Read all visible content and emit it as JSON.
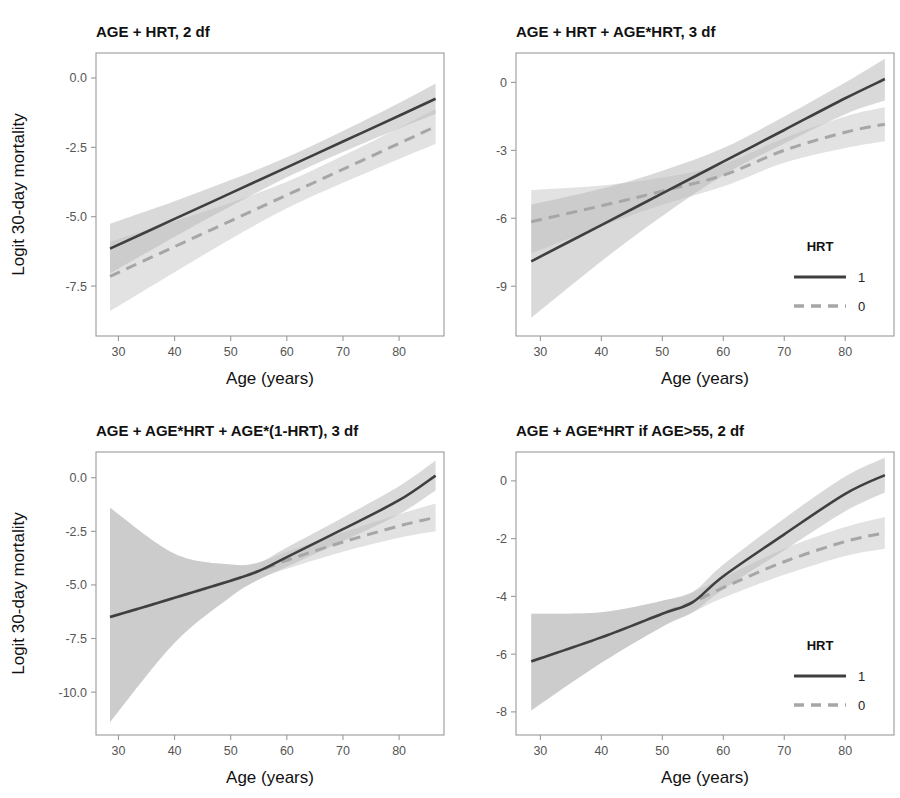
{
  "figure": {
    "width": 900,
    "height": 798,
    "background": "#ffffff",
    "panel_count": 4
  },
  "style": {
    "solid_line_color": "#3f3f3f",
    "dashed_line_color": "#a6a6a6",
    "band_solid_color": "#b9b9b9",
    "band_dashed_color": "#d8d8d8",
    "frame_color": "#9a9a9a",
    "tick_label_color": "#555555",
    "title_color": "#111111"
  },
  "legend": {
    "title": "HRT",
    "entries": [
      {
        "label": "1",
        "style": "solid",
        "color": "#3f3f3f"
      },
      {
        "label": "0",
        "style": "dashed",
        "color": "#a6a6a6"
      }
    ]
  },
  "axes_common": {
    "xlabel": "Age (years)",
    "ylabel": "Logit 30-day mortality",
    "xlim": [
      26,
      88
    ],
    "xticks": [
      30,
      40,
      50,
      60,
      70,
      80
    ],
    "xticklabels": [
      "30",
      "40",
      "50",
      "60",
      "70",
      "80"
    ],
    "grid": false,
    "x_data_range": [
      28.5,
      86.5
    ]
  },
  "chart_data": [
    {
      "id": "panel-tl",
      "type": "line",
      "position": "top-left",
      "title": "AGE + HRT, 2 df",
      "xlabel": "Age (years)",
      "ylabel": "Logit 30-day mortality",
      "xlim": [
        26,
        88
      ],
      "ylim": [
        -9.3,
        0.9
      ],
      "xticks": [
        30,
        40,
        50,
        60,
        70,
        80
      ],
      "xticklabels": [
        "30",
        "40",
        "50",
        "60",
        "70",
        "80"
      ],
      "yticks": [
        0.0,
        -2.5,
        -5.0,
        -7.5
      ],
      "yticklabels": [
        "0.0",
        "-2.5",
        "-5.0",
        "-7.5"
      ],
      "show_ylabel": true,
      "show_legend": false,
      "grid": false,
      "x": [
        28.5,
        40,
        50,
        60,
        70,
        80,
        86.5
      ],
      "series": [
        {
          "name": "1",
          "style": "solid",
          "color": "#3f3f3f",
          "values": [
            -6.15,
            -5.08,
            -4.15,
            -3.22,
            -2.29,
            -1.36,
            -0.75
          ],
          "ci_lower": [
            -7.05,
            -5.72,
            -4.62,
            -3.58,
            -2.67,
            -1.82,
            -1.3
          ],
          "ci_upper": [
            -5.25,
            -4.44,
            -3.68,
            -2.86,
            -1.91,
            -0.9,
            -0.2
          ]
        },
        {
          "name": "0",
          "style": "dashed",
          "color": "#a6a6a6",
          "values": [
            -7.15,
            -6.08,
            -5.15,
            -4.22,
            -3.29,
            -2.36,
            -1.75
          ],
          "ci_lower": [
            -8.4,
            -7.0,
            -5.8,
            -4.7,
            -3.78,
            -2.92,
            -2.38
          ],
          "ci_upper": [
            -5.9,
            -5.16,
            -4.5,
            -3.74,
            -2.8,
            -1.8,
            -1.12
          ]
        }
      ]
    },
    {
      "id": "panel-tr",
      "type": "line",
      "position": "top-right",
      "title": "AGE + HRT + AGE*HRT, 3 df",
      "xlabel": "Age (years)",
      "ylabel": "",
      "xlim": [
        26,
        88
      ],
      "ylim": [
        -11.2,
        1.3
      ],
      "xticks": [
        30,
        40,
        50,
        60,
        70,
        80
      ],
      "xticklabels": [
        "30",
        "40",
        "50",
        "60",
        "70",
        "80"
      ],
      "yticks": [
        0,
        -3,
        -6,
        -9
      ],
      "yticklabels": [
        "0",
        "-3",
        "-6",
        "-9"
      ],
      "show_ylabel": false,
      "show_legend": true,
      "grid": false,
      "x": [
        28.5,
        40,
        50,
        60,
        70,
        80,
        86.5
      ],
      "series": [
        {
          "name": "1",
          "style": "solid",
          "color": "#3f3f3f",
          "values": [
            -7.9,
            -6.3,
            -4.9,
            -3.5,
            -2.1,
            -0.7,
            0.15
          ],
          "ci_lower": [
            -10.4,
            -7.9,
            -5.9,
            -4.1,
            -2.7,
            -1.4,
            -0.8
          ],
          "ci_upper": [
            -5.4,
            -4.7,
            -3.9,
            -2.9,
            -1.5,
            0.0,
            1.05
          ]
        },
        {
          "name": "0",
          "style": "dashed",
          "color": "#a6a6a6",
          "values": [
            -6.15,
            -5.45,
            -4.8,
            -4.1,
            -3.0,
            -2.2,
            -1.85
          ],
          "ci_lower": [
            -7.55,
            -6.35,
            -5.4,
            -4.6,
            -3.55,
            -2.9,
            -2.6
          ],
          "ci_upper": [
            -4.75,
            -4.55,
            -4.2,
            -3.6,
            -2.45,
            -1.5,
            -1.1
          ]
        }
      ]
    },
    {
      "id": "panel-bl",
      "type": "line",
      "position": "bottom-left",
      "title": "AGE + AGE*HRT + AGE*(1-HRT), 3 df",
      "xlabel": "Age (years)",
      "ylabel": "Logit 30-day mortality",
      "xlim": [
        26,
        88
      ],
      "ylim": [
        -12.0,
        1.2
      ],
      "xticks": [
        30,
        40,
        50,
        60,
        70,
        80
      ],
      "xticklabels": [
        "30",
        "40",
        "50",
        "60",
        "70",
        "80"
      ],
      "yticks": [
        0.0,
        -2.5,
        -5.0,
        -7.5,
        -10.0
      ],
      "yticklabels": [
        "0.0",
        "-2.5",
        "-5.0",
        "-7.5",
        "-10.0"
      ],
      "show_ylabel": true,
      "show_legend": false,
      "grid": false,
      "x": [
        28.5,
        40,
        50,
        55,
        60,
        70,
        80,
        86.5
      ],
      "series": [
        {
          "name": "1",
          "style": "solid",
          "color": "#3f3f3f",
          "values": [
            -6.5,
            -5.6,
            -4.8,
            -4.35,
            -3.7,
            -2.4,
            -1.05,
            0.1
          ],
          "ci_lower": [
            -11.4,
            -7.7,
            -5.55,
            -4.75,
            -4.15,
            -2.95,
            -1.7,
            -0.6
          ],
          "ci_upper": [
            -1.4,
            -3.55,
            -4.05,
            -3.95,
            -3.25,
            -1.85,
            -0.4,
            0.8
          ]
        },
        {
          "name": "0",
          "style": "dashed",
          "color": "#a6a6a6",
          "values": [
            -6.5,
            -5.6,
            -4.8,
            -4.35,
            -3.85,
            -3.0,
            -2.25,
            -1.85
          ],
          "ci_lower": [
            -11.4,
            -7.7,
            -5.55,
            -4.75,
            -4.25,
            -3.45,
            -2.8,
            -2.5
          ],
          "ci_upper": [
            -1.4,
            -3.55,
            -4.05,
            -3.95,
            -3.45,
            -2.55,
            -1.7,
            -1.2
          ]
        }
      ]
    },
    {
      "id": "panel-br",
      "type": "line",
      "position": "bottom-right",
      "title": "AGE + AGE*HRT if AGE>55, 2 df",
      "xlabel": "Age (years)",
      "ylabel": "",
      "xlim": [
        26,
        88
      ],
      "ylim": [
        -8.8,
        1.0
      ],
      "xticks": [
        30,
        40,
        50,
        60,
        70,
        80
      ],
      "xticklabels": [
        "30",
        "40",
        "50",
        "60",
        "70",
        "80"
      ],
      "yticks": [
        0,
        -2,
        -4,
        -6,
        -8
      ],
      "yticklabels": [
        "0",
        "-2",
        "-4",
        "-6",
        "-8"
      ],
      "show_ylabel": false,
      "show_legend": true,
      "grid": false,
      "x": [
        28.5,
        40,
        50,
        55,
        60,
        70,
        80,
        86.5
      ],
      "series": [
        {
          "name": "1",
          "style": "solid",
          "color": "#3f3f3f",
          "values": [
            -6.25,
            -5.42,
            -4.6,
            -4.2,
            -3.3,
            -1.85,
            -0.45,
            0.2
          ],
          "ci_lower": [
            -7.95,
            -6.3,
            -5.05,
            -4.55,
            -3.75,
            -2.4,
            -1.05,
            -0.4
          ],
          "ci_upper": [
            -4.6,
            -4.55,
            -4.15,
            -3.85,
            -2.9,
            -1.3,
            0.15,
            0.8
          ]
        },
        {
          "name": "0",
          "style": "dashed",
          "color": "#a6a6a6",
          "values": [
            -6.25,
            -5.42,
            -4.6,
            -4.2,
            -3.7,
            -2.8,
            -2.1,
            -1.8
          ],
          "ci_lower": [
            -7.95,
            -6.3,
            -5.05,
            -4.55,
            -4.05,
            -3.25,
            -2.6,
            -2.35
          ],
          "ci_upper": [
            -4.6,
            -4.55,
            -4.15,
            -3.85,
            -3.35,
            -2.35,
            -1.6,
            -1.25
          ]
        }
      ]
    }
  ]
}
